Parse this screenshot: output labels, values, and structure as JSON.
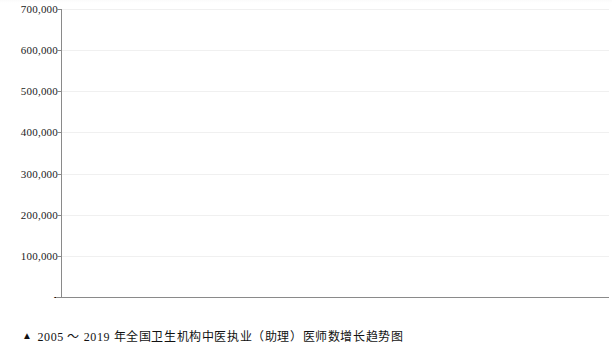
{
  "caption": {
    "marker": "▲",
    "text": "2005 ～ 2019 年全国卫生机构中医执业（助理）医师数增长趋势图"
  },
  "chart_data": {
    "type": "bar",
    "title": "",
    "subtitle": "",
    "xlabel": "",
    "ylabel": "",
    "categories": [
      "2005",
      "2006",
      "2007",
      "2008",
      "2009",
      "2010",
      "2011",
      "2012",
      "2013",
      "2014",
      "2015",
      "2016",
      "2017",
      "2018",
      "2019"
    ],
    "values": [
      234685,
      236545,
      241993,
      253233,
      272579,
      294104,
      309272,
      356779,
      381682,
      418573,
      452190,
      481590,
      527037,
      575454,
      624783
    ],
    "value_labels": [
      "234,685",
      "236,545",
      "241,993",
      "253,233",
      "272,579",
      "294,104",
      "309,272",
      "356,779",
      "381,682",
      "418,573",
      "452,190",
      "481,590",
      "527,037",
      "575,454",
      "624,783"
    ],
    "ylim": [
      0,
      700000
    ],
    "ytick_values": [
      0,
      100000,
      200000,
      300000,
      400000,
      500000,
      600000,
      700000
    ],
    "ytick_labels": [
      "-",
      "100,000",
      "200,000",
      "300,000",
      "400,000",
      "500,000",
      "600,000",
      "700,000"
    ],
    "grid": true,
    "grid_axis": "y",
    "legend": null,
    "series": [
      {
        "name": "中医执业（助理）医师数",
        "values": [
          234685,
          236545,
          241993,
          253233,
          272579,
          294104,
          309272,
          356779,
          381682,
          418573,
          452190,
          481590,
          527037,
          575454,
          624783
        ],
        "color": "#1c1c1c"
      }
    ],
    "bar_color": "#1c1c1c",
    "background_color": "#ffffff",
    "axis_color": "#8a8a8a",
    "gridline_color": "#f0f0f0"
  }
}
